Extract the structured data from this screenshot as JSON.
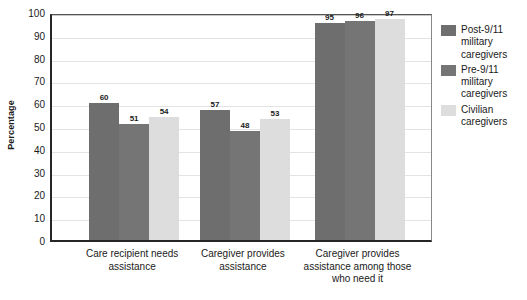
{
  "chart_data": {
    "type": "bar",
    "title": "",
    "xlabel": "",
    "ylabel": "Percentage",
    "ylim": [
      0,
      100
    ],
    "ytick_step": 10,
    "yticks": [
      100,
      90,
      80,
      70,
      60,
      50,
      40,
      30,
      20,
      10,
      0
    ],
    "grid": true,
    "legend_position": "right",
    "categories": [
      "Care recipient needs assistance",
      "Caregiver provides assistance",
      "Caregiver provides assistance among those who need it"
    ],
    "series": [
      {
        "name": "Post-9/11 military caregivers",
        "color": "#6e6e6e",
        "values": [
          60,
          57,
          95
        ]
      },
      {
        "name": "Pre-9/11 military caregivers",
        "color": "#757575",
        "values": [
          51,
          48,
          96
        ]
      },
      {
        "name": "Civilian caregivers",
        "color": "#dddddd",
        "values": [
          54,
          53,
          97
        ]
      }
    ]
  }
}
